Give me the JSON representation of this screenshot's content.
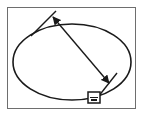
{
  "diagram": {
    "type": "ellipse-diameter-measurement",
    "stroke_color": "#1a1a1a",
    "frame_color": "#6e6e6e",
    "ellipse": {
      "cx": 72,
      "cy": 62,
      "rx": 59,
      "ry": 38
    },
    "dimension_arrow": {
      "x1": 54,
      "y1": 18,
      "x2": 108,
      "y2": 82,
      "heads": "both"
    },
    "extension_lines": [
      {
        "x1": 31,
        "y1": 36,
        "x2": 56,
        "y2": 11
      },
      {
        "x1": 98,
        "y1": 97,
        "x2": 117,
        "y2": 73
      }
    ],
    "handle_box": {
      "x": 88,
      "y": 92,
      "w": 12,
      "h": 11
    }
  }
}
